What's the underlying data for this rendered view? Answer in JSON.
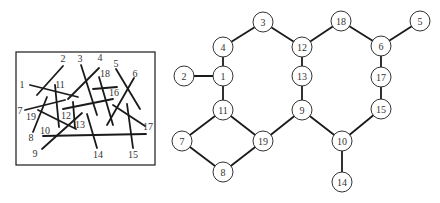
{
  "figure": {
    "left_panel": {
      "description": "Line segments labeled 1-19 drawn inside a rectangle",
      "frame": {
        "x": 16,
        "y": 52,
        "width": 139,
        "height": 113
      },
      "segments": [
        {
          "id": "1",
          "x1": 30,
          "y1": 85,
          "x2": 78,
          "y2": 97,
          "lx": 22,
          "ly": 88
        },
        {
          "id": "2",
          "x1": 63,
          "y1": 66,
          "x2": 37,
          "y2": 95,
          "lx": 63,
          "ly": 62
        },
        {
          "id": "3",
          "x1": 81,
          "y1": 65,
          "x2": 97,
          "y2": 115,
          "lx": 80,
          "ly": 62
        },
        {
          "id": "4",
          "x1": 99,
          "y1": 68,
          "x2": 68,
          "y2": 99,
          "lx": 100,
          "ly": 61
        },
        {
          "id": "5",
          "x1": 116,
          "y1": 69,
          "x2": 140,
          "y2": 109,
          "lx": 116,
          "ly": 67
        },
        {
          "id": "6",
          "x1": 134,
          "y1": 78,
          "x2": 107,
          "y2": 125,
          "lx": 135,
          "ly": 77
        },
        {
          "id": "7",
          "x1": 25,
          "y1": 110,
          "x2": 65,
          "y2": 100,
          "lx": 20,
          "ly": 114
        },
        {
          "id": "8",
          "x1": 47,
          "y1": 97,
          "x2": 33,
          "y2": 132,
          "lx": 31,
          "ly": 141
        },
        {
          "id": "9",
          "x1": 42,
          "y1": 149,
          "x2": 82,
          "y2": 113,
          "lx": 35,
          "ly": 157
        },
        {
          "id": "10",
          "x1": 43,
          "y1": 136,
          "x2": 146,
          "y2": 134,
          "lx": 45,
          "ly": 134
        },
        {
          "id": "11",
          "x1": 55,
          "y1": 85,
          "x2": 59,
          "y2": 127,
          "lx": 60,
          "ly": 88
        },
        {
          "id": "12",
          "x1": 63,
          "y1": 109,
          "x2": 113,
          "y2": 99,
          "lx": 66,
          "ly": 119
        },
        {
          "id": "13",
          "x1": 73,
          "y1": 102,
          "x2": 75,
          "y2": 128,
          "lx": 80,
          "ly": 128
        },
        {
          "id": "14",
          "x1": 87,
          "y1": 114,
          "x2": 97,
          "y2": 148,
          "lx": 98,
          "ly": 158
        },
        {
          "id": "15",
          "x1": 127,
          "y1": 104,
          "x2": 133,
          "y2": 148,
          "lx": 133,
          "ly": 158
        },
        {
          "id": "16",
          "x1": 93,
          "y1": 89,
          "x2": 117,
          "y2": 87,
          "lx": 114,
          "ly": 96
        },
        {
          "id": "17",
          "x1": 113,
          "y1": 105,
          "x2": 145,
          "y2": 126,
          "lx": 148,
          "ly": 130
        },
        {
          "id": "18",
          "x1": 99,
          "y1": 77,
          "x2": 113,
          "y2": 125,
          "lx": 105,
          "ly": 77
        },
        {
          "id": "19",
          "x1": 38,
          "y1": 110,
          "x2": 76,
          "y2": 129,
          "lx": 31,
          "ly": 120
        }
      ]
    },
    "right_panel": {
      "description": "Intersection graph: nodes are segments, edges connect intersecting segments",
      "node_radius": 10,
      "nodes": [
        {
          "id": "1",
          "x": 223,
          "y": 76
        },
        {
          "id": "2",
          "x": 184,
          "y": 76
        },
        {
          "id": "3",
          "x": 263,
          "y": 22
        },
        {
          "id": "4",
          "x": 223,
          "y": 47
        },
        {
          "id": "5",
          "x": 420,
          "y": 21
        },
        {
          "id": "6",
          "x": 381,
          "y": 46
        },
        {
          "id": "7",
          "x": 182,
          "y": 141
        },
        {
          "id": "8",
          "x": 223,
          "y": 172
        },
        {
          "id": "9",
          "x": 302,
          "y": 110
        },
        {
          "id": "10",
          "x": 342,
          "y": 141
        },
        {
          "id": "11",
          "x": 223,
          "y": 110
        },
        {
          "id": "12",
          "x": 302,
          "y": 47
        },
        {
          "id": "13",
          "x": 302,
          "y": 76
        },
        {
          "id": "14",
          "x": 342,
          "y": 182
        },
        {
          "id": "15",
          "x": 381,
          "y": 109
        },
        {
          "id": "17",
          "x": 381,
          "y": 77
        },
        {
          "id": "18",
          "x": 341,
          "y": 21
        },
        {
          "id": "19",
          "x": 263,
          "y": 141
        }
      ],
      "edges": [
        [
          "2",
          "1"
        ],
        [
          "1",
          "4"
        ],
        [
          "4",
          "3"
        ],
        [
          "3",
          "12"
        ],
        [
          "12",
          "18"
        ],
        [
          "18",
          "6"
        ],
        [
          "6",
          "5"
        ],
        [
          "12",
          "13"
        ],
        [
          "13",
          "9"
        ],
        [
          "6",
          "17"
        ],
        [
          "17",
          "15"
        ],
        [
          "15",
          "10"
        ],
        [
          "9",
          "10"
        ],
        [
          "10",
          "14"
        ],
        [
          "1",
          "11"
        ],
        [
          "11",
          "7"
        ],
        [
          "11",
          "19"
        ],
        [
          "7",
          "8"
        ],
        [
          "8",
          "19"
        ],
        [
          "19",
          "9"
        ]
      ]
    },
    "colors": {
      "line": "#1a1a1a",
      "node_fill": "#ffffff",
      "node_stroke": "#333333",
      "text": "#333333"
    }
  }
}
